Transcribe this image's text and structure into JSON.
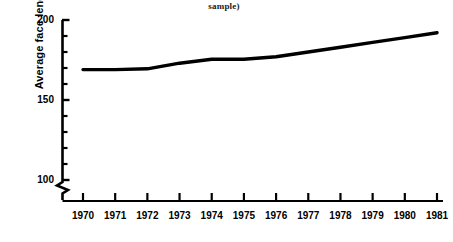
{
  "chart_data": {
    "type": "line",
    "title": "sample)",
    "xlabel": "",
    "ylabel": "Average face length (m)",
    "x": [
      1970,
      1971,
      1972,
      1973,
      1974,
      1975,
      1976,
      1977,
      1978,
      1979,
      1980,
      1981
    ],
    "categories": [
      "1970",
      "1971",
      "1972",
      "1973",
      "1974",
      "1975",
      "1976",
      "1977",
      "1978",
      "1979",
      "1980",
      "1981"
    ],
    "values": [
      169,
      169,
      169.5,
      173,
      175.5,
      175.5,
      177,
      180,
      183,
      186,
      189,
      192
    ],
    "series": [
      {
        "name": "Average face length",
        "values": [
          169,
          169,
          169.5,
          173,
          175.5,
          175.5,
          177,
          180,
          183,
          186,
          189,
          192
        ]
      }
    ],
    "ylim": [
      100,
      200
    ],
    "ytick_labels": [
      "200",
      "150",
      "100"
    ],
    "ytick_values": [
      200,
      150,
      100
    ],
    "y_minor_tick_count_per_major": 5,
    "xlim": [
      1970,
      1981
    ],
    "grid": false,
    "legend": false,
    "legend_position": "none",
    "axis_break": true,
    "axis_break_note": "zigzag break on y-axis below 100",
    "line_color": "#000000",
    "background_color": "#ffffff"
  },
  "axes": {
    "y_title": "Average face length (m)",
    "y_ticks": [
      {
        "label": "200",
        "value": 200
      },
      {
        "label": "150",
        "value": 150
      },
      {
        "label": "100",
        "value": 100
      }
    ],
    "x_ticks": [
      {
        "label": "1970",
        "value": 1970
      },
      {
        "label": "1971",
        "value": 1971
      },
      {
        "label": "1972",
        "value": 1972
      },
      {
        "label": "1973",
        "value": 1973
      },
      {
        "label": "1974",
        "value": 1974
      },
      {
        "label": "1975",
        "value": 1975
      },
      {
        "label": "1976",
        "value": 1976
      },
      {
        "label": "1977",
        "value": 1977
      },
      {
        "label": "1978",
        "value": 1978
      },
      {
        "label": "1979",
        "value": 1979
      },
      {
        "label": "1980",
        "value": 1980
      },
      {
        "label": "1981",
        "value": 1981
      }
    ]
  },
  "caption": {
    "title_fragment": "sample)"
  }
}
